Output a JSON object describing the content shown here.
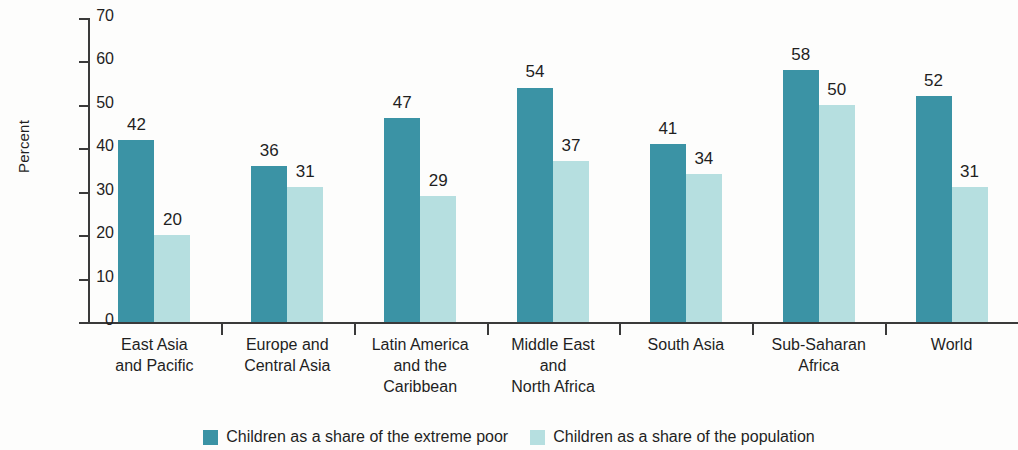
{
  "chart_data": {
    "type": "bar",
    "title": "",
    "subtitle": "",
    "xlabel": "",
    "ylabel": "Percent",
    "ylim": [
      0,
      70
    ],
    "yticks": [
      0,
      10,
      20,
      30,
      40,
      50,
      60,
      70
    ],
    "grid": false,
    "legend_position": "bottom",
    "categories": [
      "East Asia\nand Pacific",
      "Europe and\nCentral Asia",
      "Latin America\nand the\nCaribbean",
      "Middle East\nand\nNorth Africa",
      "South Asia",
      "Sub-Saharan\nAfrica",
      "World"
    ],
    "category_lines": [
      [
        "East Asia",
        "and Pacific"
      ],
      [
        "Europe and",
        "Central Asia"
      ],
      [
        "Latin America",
        "and the",
        "Caribbean"
      ],
      [
        "Middle East",
        "and",
        "North Africa"
      ],
      [
        "South Asia"
      ],
      [
        "Sub-Saharan",
        "Africa"
      ],
      [
        "World"
      ]
    ],
    "series": [
      {
        "name": "Children as a share of the extreme poor",
        "color": "#3b93a5",
        "values": [
          42,
          36,
          47,
          54,
          41,
          58,
          52
        ]
      },
      {
        "name": "Children as a share of the population",
        "color": "#b6dfe0",
        "values": [
          20,
          31,
          29,
          37,
          34,
          50,
          31
        ]
      }
    ]
  },
  "axis": {
    "y_title": "Percent",
    "y_tick_labels": [
      "70",
      "60",
      "50",
      "40",
      "30",
      "20",
      "10",
      "0"
    ]
  },
  "legend": {
    "items": [
      {
        "label": "Children as a share of the extreme poor",
        "color": "#3b93a5"
      },
      {
        "label": "Children as a share of the population",
        "color": "#b6dfe0"
      }
    ]
  },
  "colors": {
    "series_dark": "#3b93a5",
    "series_light": "#b6dfe0",
    "axis": "#3a3a3a",
    "text": "#1f1f1f",
    "background": "#fdfdfc"
  }
}
